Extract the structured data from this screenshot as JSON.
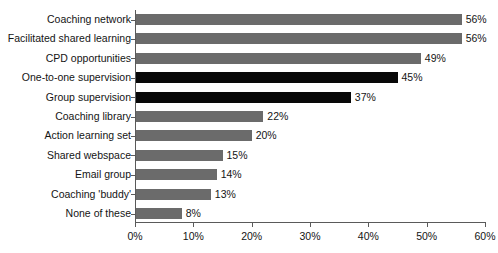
{
  "chart_data": {
    "type": "bar",
    "orientation": "horizontal",
    "title": "",
    "xlabel": "",
    "ylabel": "",
    "xlim": [
      0,
      60
    ],
    "xtick_labels": [
      "0%",
      "10%",
      "20%",
      "30%",
      "40%",
      "50%",
      "60%"
    ],
    "xticks": [
      0,
      10,
      20,
      30,
      40,
      50,
      60
    ],
    "grid": false,
    "legend": "none",
    "value_suffix": "%",
    "categories": [
      "Coaching network",
      "Facilitated shared learning",
      "CPD opportunities",
      "One-to-one supervision",
      "Group supervision",
      "Coaching library",
      "Action learning set",
      "Shared webspace",
      "Email group",
      "Coaching 'buddy'",
      "None of these"
    ],
    "values": [
      56,
      56,
      49,
      45,
      37,
      22,
      20,
      15,
      14,
      13,
      8
    ],
    "value_labels": [
      "56%",
      "56%",
      "49%",
      "45%",
      "37%",
      "22%",
      "20%",
      "15%",
      "14%",
      "13%",
      "8%"
    ],
    "bar_colors": [
      "#6b6b6b",
      "#6b6b6b",
      "#6b6b6b",
      "#080808",
      "#080808",
      "#6b6b6b",
      "#6b6b6b",
      "#6b6b6b",
      "#6b6b6b",
      "#6b6b6b",
      "#6b6b6b"
    ],
    "colors": {
      "bar_gray": "#6b6b6b",
      "bar_black": "#080808",
      "axis": "#5a5a5a",
      "text": "#141414",
      "background": "#ffffff"
    }
  }
}
